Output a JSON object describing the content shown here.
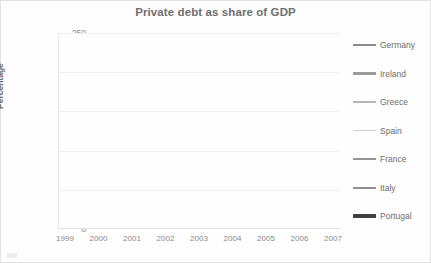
{
  "chart_data": {
    "type": "line",
    "title": "Private debt as share of GDP",
    "xlabel": "",
    "ylabel": "Percentage",
    "x": [
      1999,
      2000,
      2001,
      2002,
      2003,
      2004,
      2005,
      2006,
      2007
    ],
    "categories": [
      "1999",
      "2000",
      "2001",
      "2002",
      "2003",
      "2004",
      "2005",
      "2006",
      "2007"
    ],
    "ylim": [
      0,
      250
    ],
    "yticks": [
      0,
      50,
      100,
      150,
      200,
      250
    ],
    "grid": true,
    "legend_position": "right",
    "series": [
      {
        "name": "Germany",
        "color": "#8c8c8c",
        "width": 2.0,
        "values": [
          127,
          130,
          133,
          136,
          139,
          142,
          144,
          146,
          148
        ]
      },
      {
        "name": "Ireland",
        "color": "#9a9a9a",
        "width": 2.0,
        "values": [
          null,
          null,
          140,
          139,
          140,
          152,
          172,
          190,
          208
        ]
      },
      {
        "name": "Greece",
        "color": "#b4b4b4",
        "width": 1.8,
        "values": [
          45,
          53,
          60,
          65,
          69,
          72,
          85,
          95,
          110
        ]
      },
      {
        "name": "Spain",
        "color": "#cfcfcf",
        "width": 1.8,
        "values": [
          103,
          116,
          126,
          131,
          133,
          150,
          172,
          188,
          202
        ]
      },
      {
        "name": "France",
        "color": "#959595",
        "width": 1.8,
        "values": [
          75,
          78,
          80,
          83,
          87,
          92,
          97,
          103,
          110
        ]
      },
      {
        "name": "Italy",
        "color": "#8e8e8e",
        "width": 1.8,
        "values": [
          127,
          129,
          131,
          132,
          133,
          129,
          124,
          120,
          116
        ]
      },
      {
        "name": "Portugal",
        "color": "#3f3f3f",
        "width": 2.8,
        "values": [
          130,
          141,
          153,
          160,
          168,
          175,
          179,
          184,
          193
        ]
      }
    ]
  },
  "legend": {
    "items": [
      {
        "label": "Germany",
        "color": "#8c8c8c",
        "thickness": "2.5px"
      },
      {
        "label": "Ireland",
        "color": "#9a9a9a",
        "thickness": "2.2px"
      },
      {
        "label": "Greece",
        "color": "#b4b4b4",
        "thickness": "2px"
      },
      {
        "label": "Spain",
        "color": "#cfcfcf",
        "thickness": "1.8px"
      },
      {
        "label": "France",
        "color": "#959595",
        "thickness": "2.2px"
      },
      {
        "label": "Italy",
        "color": "#8e8e8e",
        "thickness": "2px"
      },
      {
        "label": "Portugal",
        "color": "#3f3f3f",
        "thickness": "3.2px"
      }
    ]
  }
}
